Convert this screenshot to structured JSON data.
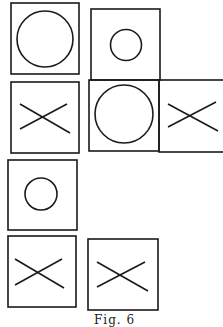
{
  "figure": {
    "caption": "Fig. 6",
    "stroke_color": "#1a1a1a",
    "background": "#ffffff",
    "boxes": [
      {
        "id": "A",
        "symbol": "large-circle",
        "x": 11,
        "y": 3,
        "w": 68,
        "h": 71
      },
      {
        "id": "B",
        "symbol": "small-circle",
        "x": 91,
        "y": 9,
        "w": 69,
        "h": 71
      },
      {
        "id": "C",
        "symbol": "cross",
        "x": 11,
        "y": 82,
        "w": 68,
        "h": 71
      },
      {
        "id": "D",
        "symbol": "large-circle",
        "x": 89,
        "y": 80,
        "w": 70,
        "h": 71
      },
      {
        "id": "E",
        "symbol": "cross",
        "x": 159,
        "y": 80,
        "w": 66,
        "h": 72
      },
      {
        "id": "F",
        "symbol": "small-circle",
        "x": 8,
        "y": 160,
        "w": 69,
        "h": 70
      },
      {
        "id": "G",
        "symbol": "cross",
        "x": 8,
        "y": 236,
        "w": 68,
        "h": 71
      },
      {
        "id": "H",
        "symbol": "cross",
        "x": 88,
        "y": 239,
        "w": 70,
        "h": 71
      }
    ]
  }
}
